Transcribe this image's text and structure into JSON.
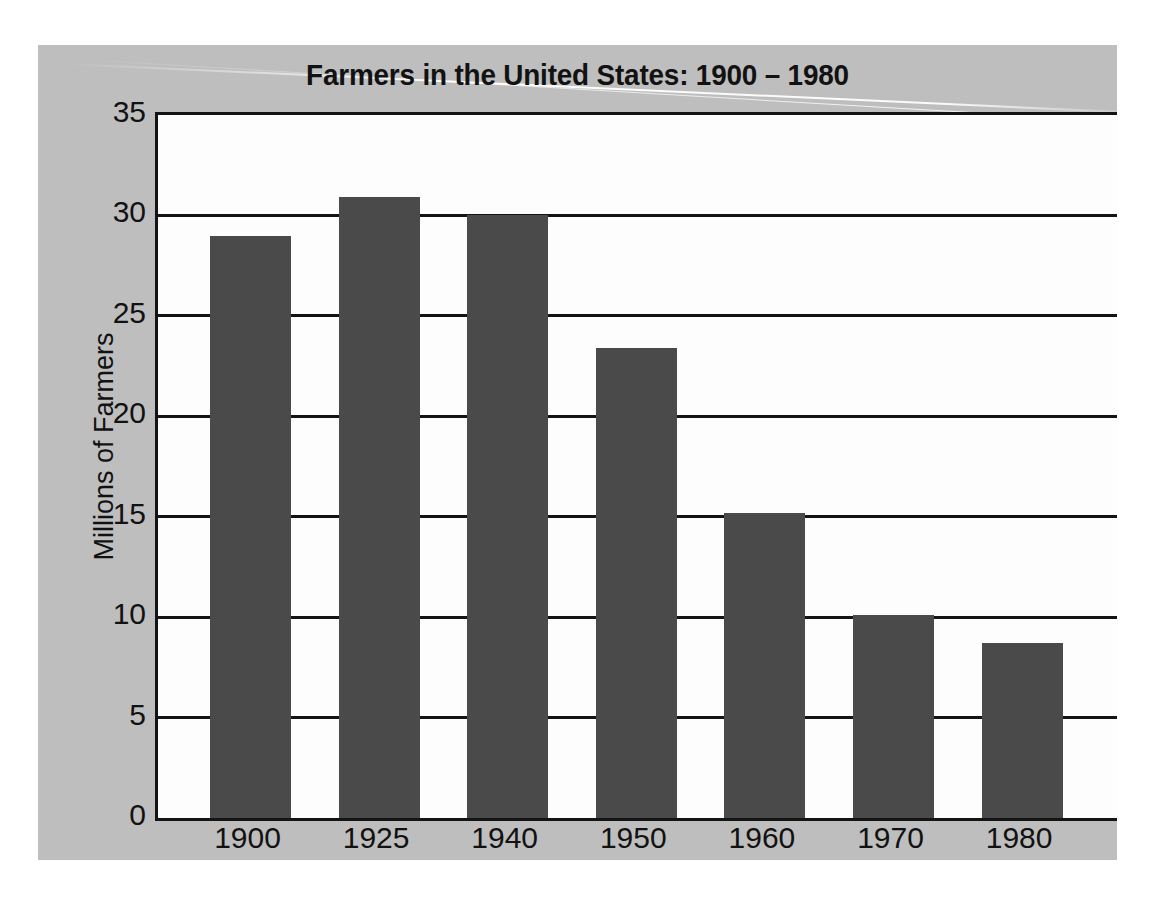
{
  "chart_data": {
    "type": "bar",
    "title": "Farmers in the United States: 1900 – 1980",
    "xlabel": "",
    "ylabel": "Millions of Farmers",
    "categories": [
      "1900",
      "1925",
      "1940",
      "1950",
      "1960",
      "1970",
      "1980"
    ],
    "values": [
      29.0,
      30.9,
      30.0,
      23.4,
      15.2,
      10.1,
      8.7
    ],
    "ylim": [
      0,
      35
    ],
    "yticks": [
      0,
      5,
      10,
      15,
      20,
      25,
      30,
      35
    ],
    "ytick_labels": [
      "0",
      "5",
      "10",
      "15",
      "20",
      "25",
      "30",
      "35"
    ],
    "grid": true,
    "legend": false,
    "colors": {
      "bar": "#4a4a4a",
      "panel_background": "#bebebe",
      "plot_background": "#fdfdfd",
      "axis": "#141414",
      "text": "#121212"
    }
  }
}
